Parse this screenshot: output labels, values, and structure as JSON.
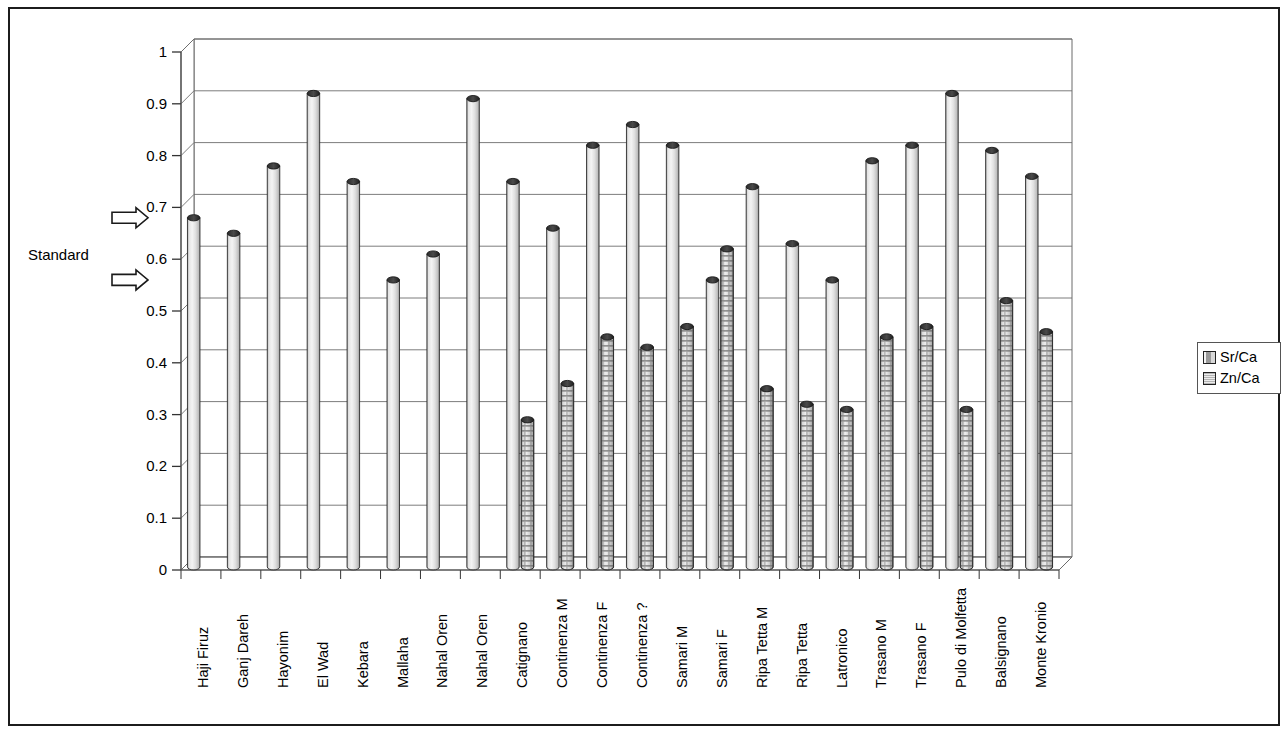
{
  "chart_data": {
    "type": "bar",
    "title": "",
    "xlabel": "",
    "ylabel": "",
    "ylim": [
      0,
      1
    ],
    "ytick_labels": [
      "0",
      "0.1",
      "0.2",
      "0.3",
      "0.4",
      "0.5",
      "0.6",
      "0.7",
      "0.8",
      "0.9",
      "1"
    ],
    "ytick_values": [
      0,
      0.1,
      0.2,
      0.3,
      0.4,
      0.5,
      0.6,
      0.7,
      0.8,
      0.9,
      1
    ],
    "grid": true,
    "legend_position": "right",
    "categories": [
      "Haji Firuz",
      "Ganj Dareh",
      "Hayonim",
      "El Wad",
      "Kebara",
      "Mallaha",
      "Nahal Oren",
      "Nahal Oren",
      "Catignano",
      "Continenza M",
      "Continenza F",
      "Continenza ?",
      "Samari M",
      "Samari F",
      "Ripa Tetta M",
      "Ripa Tetta",
      "Latronico",
      "Trasano M",
      "Trasano F",
      "Pulo di Molfetta",
      "Balsignano",
      "Monte Kronio"
    ],
    "series": [
      {
        "name": "Sr/Ca",
        "values": [
          0.68,
          0.65,
          0.78,
          0.92,
          0.75,
          0.56,
          0.61,
          0.91,
          0.75,
          0.66,
          0.82,
          0.86,
          0.82,
          0.56,
          0.74,
          0.63,
          0.56,
          0.79,
          0.82,
          0.92,
          0.81,
          0.76
        ]
      },
      {
        "name": "Zn/Ca",
        "values": [
          null,
          null,
          null,
          null,
          null,
          null,
          null,
          null,
          0.29,
          0.36,
          0.45,
          0.43,
          0.47,
          0.62,
          0.35,
          0.32,
          0.31,
          0.45,
          0.47,
          0.31,
          0.52,
          0.46
        ]
      }
    ],
    "annotations": [
      {
        "label": "Standard",
        "arrows": [
          0.68,
          0.56
        ]
      }
    ]
  },
  "legend": {
    "items": [
      {
        "label": "Sr/Ca",
        "pattern": "solid-gray"
      },
      {
        "label": "Zn/Ca",
        "pattern": "dotted-hatch"
      }
    ]
  },
  "annotation": {
    "standard_label": "Standard"
  }
}
